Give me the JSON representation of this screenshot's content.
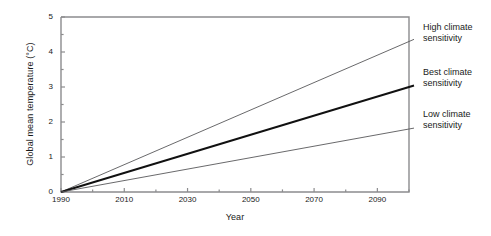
{
  "chart_data": {
    "type": "line",
    "title": "",
    "xlabel": "Year",
    "ylabel": "Global mean temperature (°C)",
    "xlim": [
      1990,
      2100
    ],
    "ylim": [
      0,
      5
    ],
    "x_major_ticks": [
      1990,
      2010,
      2030,
      2050,
      2070,
      2090
    ],
    "x_minor_ticks": [
      2000,
      2020,
      2040,
      2060,
      2080,
      2100
    ],
    "x_tick_labels": [
      "1990",
      "2010",
      "2030",
      "2050",
      "2070",
      "2090"
    ],
    "y_major_ticks": [
      0,
      1,
      2,
      3,
      4,
      5
    ],
    "y_minor_ticks": [
      0.5,
      1.5,
      2.5,
      3.5,
      4.5
    ],
    "y_tick_labels": [
      "0",
      "1",
      "2",
      "3",
      "4",
      "5"
    ],
    "grid": false,
    "legend_position": "right-of-axes",
    "line_color": "#58585a",
    "emphasis_color": "#111111",
    "frame_color": "#8c8c8e",
    "series": [
      {
        "name": "High climate sensitivity",
        "label_line1": "High climate",
        "label_line2": "sensitivity",
        "x": [
          1990,
          2100
        ],
        "values": [
          0,
          4.3
        ],
        "emphasis": false
      },
      {
        "name": "Best climate sensitivity",
        "label_line1": "Best climate",
        "label_line2": "sensitivity",
        "x": [
          1990,
          2100
        ],
        "values": [
          0,
          3.0
        ],
        "emphasis": true
      },
      {
        "name": "Low climate sensitivity",
        "label_line1": "Low climate",
        "label_line2": "sensitivity",
        "x": [
          1990,
          2100
        ],
        "values": [
          0,
          1.8
        ],
        "emphasis": false
      }
    ]
  }
}
